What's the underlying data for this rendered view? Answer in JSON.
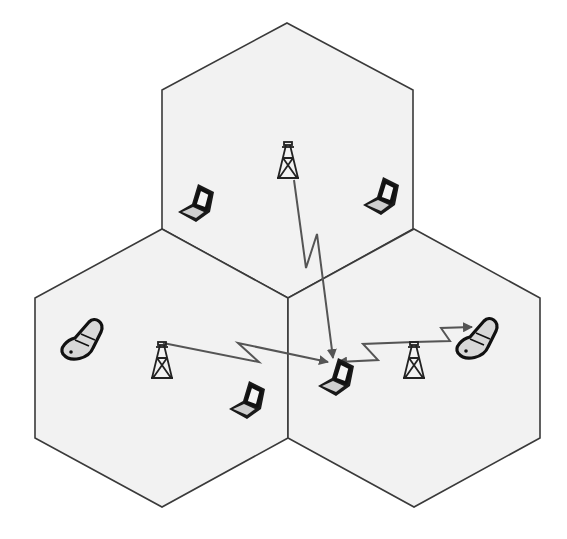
{
  "diagram": {
    "title": "",
    "colors": {
      "cell_fill": "#f2f2f2",
      "cell_stroke": "#3a3a3a",
      "link": "#555555",
      "device": "#111111"
    },
    "cells": [
      {
        "id": "cell-top",
        "points": "287,23 413,90 413,229 288,298 162,229 162,90"
      },
      {
        "id": "cell-left",
        "points": "162,229 288,298 288,438 162,507 35,438 35,298"
      },
      {
        "id": "cell-right",
        "points": "414,229 540,298 540,438 414,507 288,438 288,298"
      }
    ],
    "towers": [
      {
        "id": "tower-top",
        "x": 288,
        "y": 142
      },
      {
        "id": "tower-left",
        "x": 162,
        "y": 342
      },
      {
        "id": "tower-right",
        "x": 414,
        "y": 342
      }
    ],
    "laptops": [
      {
        "id": "laptop-top-left",
        "x": 196,
        "y": 204
      },
      {
        "id": "laptop-top-right",
        "x": 381,
        "y": 197
      },
      {
        "id": "laptop-bottom-left",
        "x": 247,
        "y": 401
      },
      {
        "id": "laptop-center",
        "x": 336,
        "y": 378
      }
    ],
    "phones": [
      {
        "id": "phone-left",
        "x": 83,
        "y": 342
      },
      {
        "id": "phone-right",
        "x": 478,
        "y": 341
      }
    ],
    "links": [
      {
        "id": "link-top-tower-to-center-laptop",
        "points": "294,180 306,268 317,234 333,358"
      },
      {
        "id": "link-left-tower-to-center-laptop",
        "points": "163,343 259,362 238,343 328,362"
      },
      {
        "id": "link-right-tower-to-center-laptop",
        "points": "414,342 363,344 378,360 338,362"
      },
      {
        "id": "link-right-tower-to-right-phone",
        "points": "414,342 450,341 441,328 472,327"
      }
    ]
  }
}
